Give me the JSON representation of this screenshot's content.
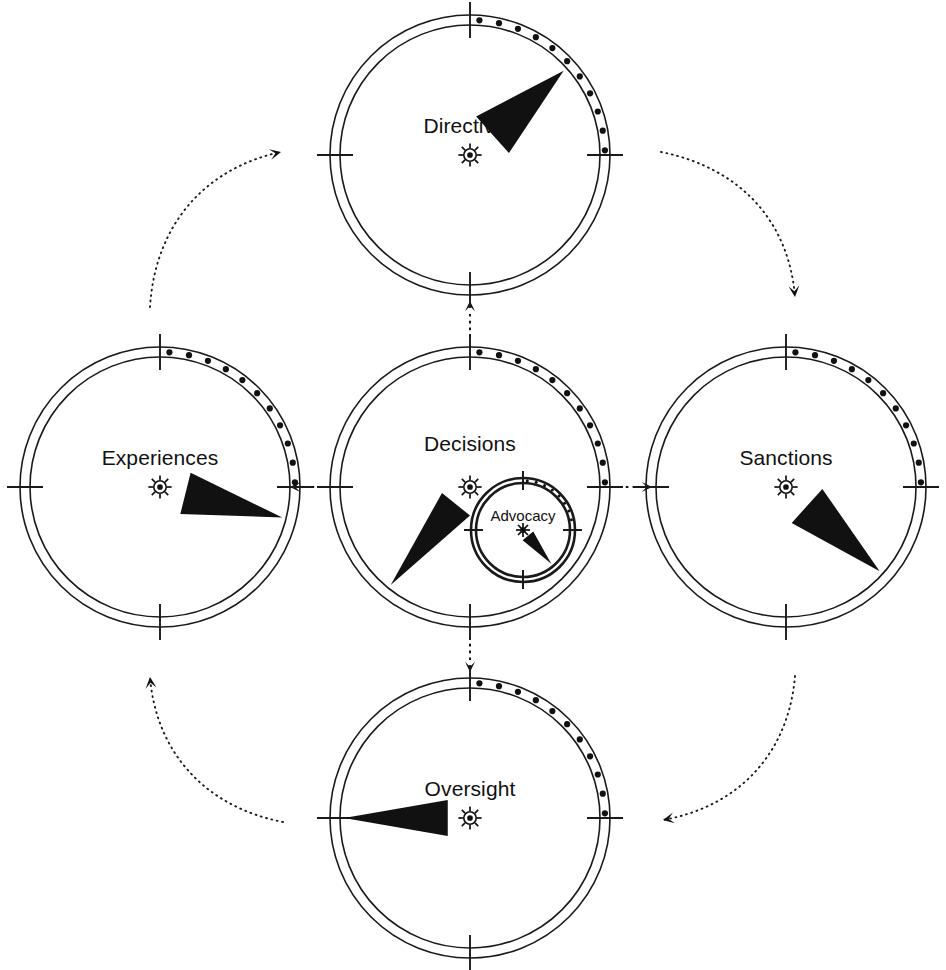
{
  "diagram": {
    "type": "cycle-diagram",
    "background_color": "#ffffff",
    "ink_color": "#111111",
    "width": 946,
    "height": 970
  },
  "gauges": [
    {
      "id": "directives",
      "label": "Directives",
      "position": "top",
      "center": {
        "x": 470,
        "y": 155
      },
      "outer_radius": 140,
      "inner_radius": 130,
      "pointer_angle_deg": 48,
      "pointer_half_width_deg": 13,
      "pointer_inner_fraction": 0.3,
      "arc_dot_count": 11,
      "arc_start_deg": 4,
      "arc_end_deg": 88,
      "tick_angles_deg": [
        0,
        90,
        180,
        270
      ],
      "label_offset_y": -28,
      "center_symbol": "sun-icon"
    },
    {
      "id": "sanctions",
      "label": "Sanctions",
      "position": "right",
      "center": {
        "x": 786,
        "y": 487
      },
      "outer_radius": 140,
      "inner_radius": 130,
      "pointer_angle_deg": 132,
      "pointer_half_width_deg": 13,
      "pointer_inner_fraction": 0.28,
      "arc_dot_count": 11,
      "arc_start_deg": 4,
      "arc_end_deg": 88,
      "tick_angles_deg": [
        0,
        90,
        180,
        270
      ],
      "label_offset_y": -28,
      "center_symbol": "sun-icon"
    },
    {
      "id": "oversight",
      "label": "Oversight",
      "position": "bottom",
      "center": {
        "x": 470,
        "y": 818
      },
      "outer_radius": 140,
      "inner_radius": 130,
      "pointer_angle_deg": 270,
      "pointer_half_width_deg": 13,
      "pointer_inner_fraction": 0.22,
      "arc_dot_count": 11,
      "arc_start_deg": 4,
      "arc_end_deg": 88,
      "tick_angles_deg": [
        0,
        90,
        180,
        270
      ],
      "label_offset_y": -28,
      "center_symbol": "sun-icon"
    },
    {
      "id": "experiences",
      "label": "Experiences",
      "position": "left",
      "center": {
        "x": 160,
        "y": 487
      },
      "outer_radius": 140,
      "inner_radius": 130,
      "pointer_angle_deg": 104,
      "pointer_half_width_deg": 13,
      "pointer_inner_fraction": 0.26,
      "arc_dot_count": 11,
      "arc_start_deg": 4,
      "arc_end_deg": 88,
      "tick_angles_deg": [
        0,
        90,
        180,
        270
      ],
      "label_offset_y": -28,
      "center_symbol": "sun-icon"
    },
    {
      "id": "decisions",
      "label": "Decisions",
      "position": "center",
      "center": {
        "x": 470,
        "y": 487
      },
      "outer_radius": 140,
      "inner_radius": 130,
      "pointer_angle_deg": 219,
      "pointer_half_width_deg": 13,
      "pointer_inner_fraction": 0.22,
      "arc_dot_count": 11,
      "arc_start_deg": 4,
      "arc_end_deg": 88,
      "tick_angles_deg": [
        0,
        90,
        180,
        270
      ],
      "label_offset_y": -42,
      "center_symbol": "sun-icon"
    }
  ],
  "sub_gauge": {
    "id": "advocacy",
    "label": "Advocacy",
    "parent": "decisions",
    "center": {
      "x": 523,
      "y": 530
    },
    "outer_radius": 52,
    "inner_radius": 47,
    "pointer_angle_deg": 140,
    "pointer_half_width_deg": 14,
    "pointer_inner_fraction": 0.22,
    "arc_dot_count": 8,
    "arc_start_deg": 5,
    "arc_end_deg": 78,
    "tick_angles_deg": [
      0,
      90,
      180,
      270
    ],
    "label_offset_y": -13,
    "center_symbol": "asterisk-icon"
  },
  "radial_connectors": [
    {
      "id": "decisions-to-directives",
      "from": "decisions",
      "to": "directives",
      "direction": "up",
      "x1": 470,
      "y1": 337,
      "x2": 470,
      "y2": 301
    },
    {
      "id": "decisions-to-sanctions",
      "from": "decisions",
      "to": "sanctions",
      "direction": "right",
      "x1": 619,
      "y1": 487,
      "x2": 652,
      "y2": 487
    },
    {
      "id": "decisions-to-oversight",
      "from": "decisions",
      "to": "oversight",
      "direction": "down",
      "x1": 470,
      "y1": 637,
      "x2": 470,
      "y2": 672
    },
    {
      "id": "decisions-to-experiences",
      "from": "decisions",
      "to": "experiences",
      "direction": "left",
      "x1": 321,
      "y1": 487,
      "x2": 290,
      "y2": 487
    }
  ],
  "cycle_connectors": [
    {
      "id": "experiences-to-directives",
      "from": "Experiences",
      "to": "Directives",
      "path": "M 150,307 C 155,225 205,168 281,152",
      "arrow_angle_deg": -14
    },
    {
      "id": "directives-to-sanctions",
      "from": "Directives",
      "to": "Sanctions",
      "path": "M 661,152 C 741,168 789,222 795,297",
      "arrow_angle_deg": 80
    },
    {
      "id": "sanctions-to-oversight",
      "from": "Sanctions",
      "to": "Oversight",
      "path": "M 795,676 C 789,750 742,806 663,820",
      "arrow_angle_deg": 172
    },
    {
      "id": "oversight-to-experiences",
      "from": "Oversight",
      "to": "Experiences",
      "path": "M 283,822 C 205,807 156,752 150,677",
      "arrow_angle_deg": -100
    }
  ],
  "cycle_order": [
    "Directives",
    "Sanctions",
    "Oversight",
    "Experiences"
  ],
  "cycle_direction": "clockwise"
}
